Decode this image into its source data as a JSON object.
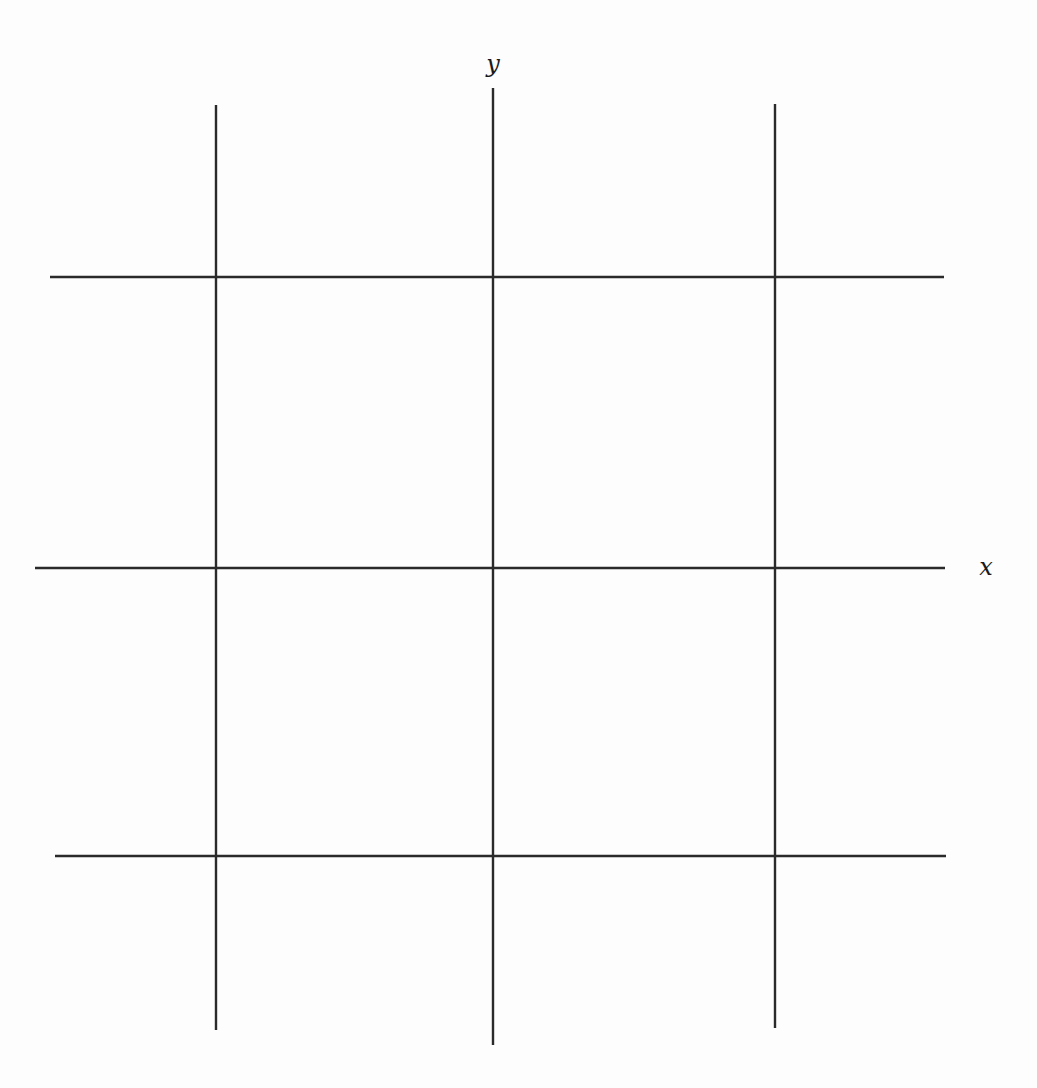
{
  "diagram": {
    "type": "grid-with-axes",
    "axes": {
      "x": {
        "label": "x"
      },
      "y": {
        "label": "y"
      }
    },
    "line_color": "#2a2a2a",
    "vertical_lines": [
      {
        "id": "v-left",
        "x": 216,
        "y1": 105,
        "y2": 1030,
        "is_axis": false
      },
      {
        "id": "v-center",
        "x": 493,
        "y1": 88,
        "y2": 1045,
        "is_axis": true
      },
      {
        "id": "v-right",
        "x": 775,
        "y1": 104,
        "y2": 1028,
        "is_axis": false
      }
    ],
    "horizontal_lines": [
      {
        "id": "h-top",
        "y": 277,
        "x1": 50,
        "x2": 944,
        "is_axis": false
      },
      {
        "id": "h-center",
        "y": 568,
        "x1": 35,
        "x2": 945,
        "is_axis": true
      },
      {
        "id": "h-bottom",
        "y": 856,
        "x1": 55,
        "x2": 946,
        "is_axis": false
      }
    ],
    "label_positions": {
      "y": {
        "x": 493,
        "y": 72
      },
      "x": {
        "x": 986,
        "y": 575
      }
    }
  }
}
